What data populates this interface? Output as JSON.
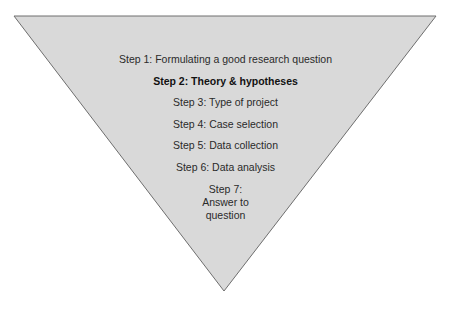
{
  "diagram": {
    "shape": "inverted-triangle",
    "fill_color": "#d9d9d9",
    "stroke_color": "#6e6e6e",
    "steps": [
      {
        "label": "Step 1: Formulating a good research question",
        "bold": false
      },
      {
        "label": "Step 2: Theory & hypotheses",
        "bold": true
      },
      {
        "label": "Step 3: Type of project",
        "bold": false
      },
      {
        "label": "Step 4: Case selection",
        "bold": false
      },
      {
        "label": "Step 5: Data collection",
        "bold": false
      },
      {
        "label": "Step 6: Data analysis",
        "bold": false
      },
      {
        "label_lines": [
          "Step 7:",
          "Answer to",
          "question"
        ],
        "bold": false
      }
    ]
  }
}
